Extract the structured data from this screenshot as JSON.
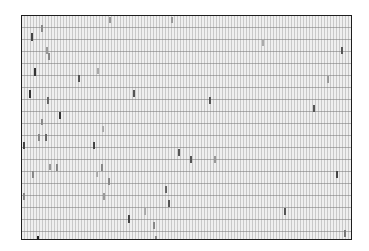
{
  "chart_data": {
    "type": "heatmap",
    "title": "",
    "xlabel": "",
    "ylabel": "",
    "grid": true,
    "frame": {
      "x": 21,
      "y": 15,
      "width": 331,
      "height": 225
    },
    "marks": [
      {
        "x": 109,
        "y": 17,
        "h": 6,
        "shade": "#999999"
      },
      {
        "x": 171,
        "y": 17,
        "h": 6,
        "shade": "#999999"
      },
      {
        "x": 41,
        "y": 25,
        "h": 7,
        "shade": "#888888"
      },
      {
        "x": 31,
        "y": 33,
        "h": 8,
        "shade": "#444444"
      },
      {
        "x": 262,
        "y": 40,
        "h": 6,
        "shade": "#aaaaaa"
      },
      {
        "x": 341,
        "y": 47,
        "h": 7,
        "shade": "#555555"
      },
      {
        "x": 46,
        "y": 47,
        "h": 7,
        "shade": "#999999"
      },
      {
        "x": 48,
        "y": 53,
        "h": 7,
        "shade": "#888888"
      },
      {
        "x": 34,
        "y": 68,
        "h": 8,
        "shade": "#333333"
      },
      {
        "x": 97,
        "y": 68,
        "h": 6,
        "shade": "#aaaaaa"
      },
      {
        "x": 78,
        "y": 75,
        "h": 7,
        "shade": "#555555"
      },
      {
        "x": 327,
        "y": 76,
        "h": 7,
        "shade": "#999999"
      },
      {
        "x": 29,
        "y": 90,
        "h": 8,
        "shade": "#333333"
      },
      {
        "x": 133,
        "y": 90,
        "h": 7,
        "shade": "#555555"
      },
      {
        "x": 47,
        "y": 97,
        "h": 7,
        "shade": "#666666"
      },
      {
        "x": 209,
        "y": 97,
        "h": 7,
        "shade": "#555555"
      },
      {
        "x": 313,
        "y": 105,
        "h": 7,
        "shade": "#555555"
      },
      {
        "x": 59,
        "y": 112,
        "h": 7,
        "shade": "#333333"
      },
      {
        "x": 41,
        "y": 119,
        "h": 6,
        "shade": "#888888"
      },
      {
        "x": 102,
        "y": 126,
        "h": 6,
        "shade": "#aaaaaa"
      },
      {
        "x": 38,
        "y": 134,
        "h": 7,
        "shade": "#888888"
      },
      {
        "x": 45,
        "y": 134,
        "h": 7,
        "shade": "#666666"
      },
      {
        "x": 23,
        "y": 142,
        "h": 7,
        "shade": "#444444"
      },
      {
        "x": 93,
        "y": 142,
        "h": 7,
        "shade": "#444444"
      },
      {
        "x": 178,
        "y": 149,
        "h": 7,
        "shade": "#555555"
      },
      {
        "x": 190,
        "y": 156,
        "h": 7,
        "shade": "#555555"
      },
      {
        "x": 214,
        "y": 156,
        "h": 7,
        "shade": "#999999"
      },
      {
        "x": 56,
        "y": 164,
        "h": 7,
        "shade": "#888888"
      },
      {
        "x": 49,
        "y": 164,
        "h": 6,
        "shade": "#999999"
      },
      {
        "x": 101,
        "y": 164,
        "h": 7,
        "shade": "#888888"
      },
      {
        "x": 32,
        "y": 171,
        "h": 7,
        "shade": "#888888"
      },
      {
        "x": 96,
        "y": 171,
        "h": 6,
        "shade": "#aaaaaa"
      },
      {
        "x": 336,
        "y": 171,
        "h": 7,
        "shade": "#444444"
      },
      {
        "x": 108,
        "y": 178,
        "h": 7,
        "shade": "#888888"
      },
      {
        "x": 165,
        "y": 186,
        "h": 7,
        "shade": "#666666"
      },
      {
        "x": 23,
        "y": 193,
        "h": 7,
        "shade": "#888888"
      },
      {
        "x": 103,
        "y": 193,
        "h": 7,
        "shade": "#999999"
      },
      {
        "x": 168,
        "y": 200,
        "h": 7,
        "shade": "#555555"
      },
      {
        "x": 144,
        "y": 208,
        "h": 7,
        "shade": "#aaaaaa"
      },
      {
        "x": 284,
        "y": 208,
        "h": 7,
        "shade": "#555555"
      },
      {
        "x": 128,
        "y": 215,
        "h": 8,
        "shade": "#444444"
      },
      {
        "x": 153,
        "y": 222,
        "h": 7,
        "shade": "#888888"
      },
      {
        "x": 344,
        "y": 230,
        "h": 7,
        "shade": "#777777"
      },
      {
        "x": 37,
        "y": 236,
        "h": 3,
        "shade": "#222222"
      },
      {
        "x": 155,
        "y": 236,
        "h": 3,
        "shade": "#888888"
      }
    ]
  }
}
